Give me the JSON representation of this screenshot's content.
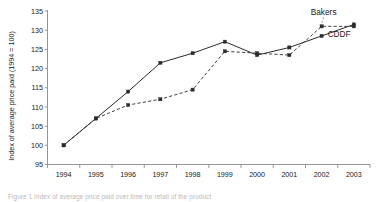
{
  "chart_data": {
    "type": "line",
    "title": "",
    "xlabel": "",
    "ylabel": "Index of average price paid (1994 = 100)",
    "categories": [
      "1994",
      "1995",
      "1996",
      "1997",
      "1998",
      "1999",
      "2000",
      "2001",
      "2002",
      "2003"
    ],
    "xlim": [
      1993.5,
      2003.5
    ],
    "ylim": [
      95,
      135
    ],
    "yticks": [
      95,
      100,
      105,
      110,
      115,
      120,
      125,
      130,
      135
    ],
    "grid": false,
    "legend_position": "inline-annotation",
    "series": [
      {
        "name": "CDDF",
        "style": "solid",
        "marker": "square",
        "values": [
          100,
          107,
          114,
          121.5,
          124,
          127,
          123.5,
          125.5,
          128.5,
          131.5
        ]
      },
      {
        "name": "Bakers",
        "style": "dashed",
        "marker": "square",
        "values": [
          100,
          107,
          110.5,
          112,
          114.5,
          124.5,
          124,
          123.5,
          131,
          131
        ]
      }
    ],
    "annotations": [
      {
        "text": "Bakers",
        "series": "Bakers",
        "anchor_year": 2002
      },
      {
        "text": "CDDF",
        "series": "CDDF",
        "anchor_year": 2002
      }
    ]
  },
  "caption": {
    "text": "Figure 1  Index of average price paid over time for retail of the product"
  },
  "colors": {
    "axis": "#8a8a8a",
    "series": "#2b2b2b",
    "background": "#ffffff",
    "text": "#1a1a1a"
  }
}
